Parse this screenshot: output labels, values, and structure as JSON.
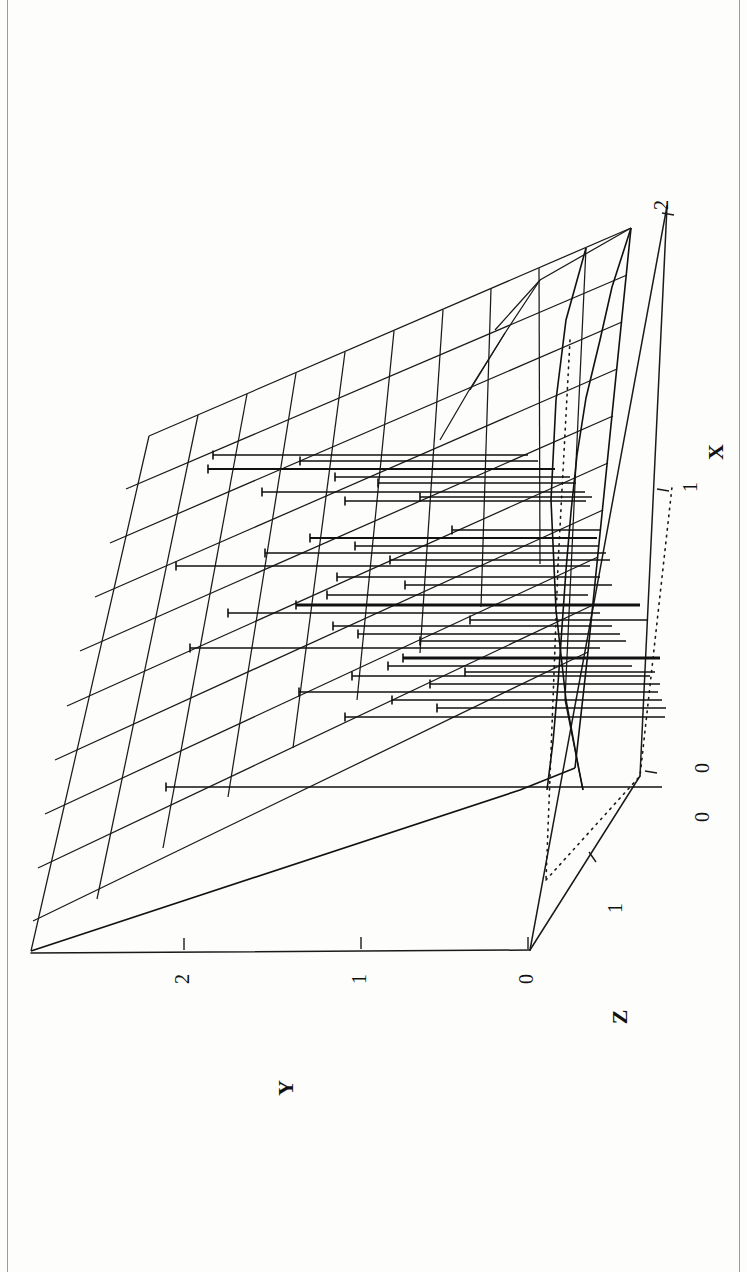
{
  "figure": {
    "kind": "3d-mesh-surface-plot",
    "orientation": "rotated-90-landscape-on-portrait-page",
    "background_color": "#fdfdfc",
    "ink_color": "#111111"
  },
  "axes": {
    "x": {
      "label": "X",
      "ticks": [
        "0",
        "1",
        "2"
      ],
      "tick_values": [
        0,
        1,
        2
      ],
      "range": [
        0,
        2
      ]
    },
    "y": {
      "label": "Y",
      "ticks": [
        "0",
        "1",
        "2"
      ],
      "tick_values": [
        0,
        1,
        2
      ],
      "range": [
        0,
        2
      ]
    },
    "z": {
      "label": "Z",
      "ticks": [
        "0",
        "1"
      ],
      "tick_values": [
        0,
        1
      ],
      "range": [
        0,
        1
      ]
    }
  },
  "chart_data": {
    "type": "line",
    "title": "",
    "subtitle": "",
    "xlabel": "X",
    "ylabel": "Y",
    "zlabel": "Z",
    "xlim": [
      0,
      2
    ],
    "ylim": [
      0,
      2
    ],
    "zlim": [
      0,
      1
    ],
    "grid": true,
    "legend": "none",
    "projection": "3d-perspective",
    "annotations": [],
    "mesh": {
      "description": "Regular quadrilateral wireframe surface mesh spanning the X-Y domain",
      "rows": 10,
      "cols": 10,
      "u_range": [
        0,
        2
      ],
      "v_range": [
        0,
        2
      ]
    },
    "reference_lines": [
      {
        "name": "vertical-dotted-dropline",
        "style": "dotted"
      },
      {
        "name": "diagonal-dotted-baseline",
        "style": "dotted"
      }
    ],
    "series": [
      {
        "name": "horizontal-data-segments",
        "description": "Horizontal line segments with end tick caps drawn across the mesh surface (interval / error-bar style markers)",
        "count": 34,
        "segments": [
          {
            "y": 455,
            "x0": 213,
            "x1": 528,
            "w": 1.5,
            "cap": "left"
          },
          {
            "y": 461,
            "x0": 300,
            "x1": 538,
            "w": 1.5,
            "cap": "left"
          },
          {
            "y": 469,
            "x0": 208,
            "x1": 555,
            "w": 1.9,
            "cap": "left"
          },
          {
            "y": 477,
            "x0": 335,
            "x1": 570,
            "w": 1.3,
            "cap": "left"
          },
          {
            "y": 483,
            "x0": 378,
            "x1": 576,
            "w": 1.3,
            "cap": "left"
          },
          {
            "y": 492,
            "x0": 262,
            "x1": 585,
            "w": 1.3,
            "cap": "left"
          },
          {
            "y": 501,
            "x0": 345,
            "x1": 586,
            "w": 1.3,
            "cap": "left"
          },
          {
            "y": 538,
            "x0": 310,
            "x1": 597,
            "w": 1.8,
            "cap": "left"
          },
          {
            "y": 546,
            "x0": 355,
            "x1": 598,
            "w": 1.3,
            "cap": "left"
          },
          {
            "y": 553,
            "x0": 265,
            "x1": 606,
            "w": 1.4,
            "cap": "left"
          },
          {
            "y": 560,
            "x0": 390,
            "x1": 610,
            "w": 1.3,
            "cap": "left"
          },
          {
            "y": 566,
            "x0": 176,
            "x1": 590,
            "w": 1.5,
            "cap": "left"
          },
          {
            "y": 577,
            "x0": 337,
            "x1": 600,
            "w": 1.3,
            "cap": "left"
          },
          {
            "y": 585,
            "x0": 405,
            "x1": 612,
            "w": 1.3,
            "cap": "left"
          },
          {
            "y": 595,
            "x0": 327,
            "x1": 588,
            "w": 1.4,
            "cap": "left"
          },
          {
            "y": 605,
            "x0": 296,
            "x1": 640,
            "w": 3.1,
            "cap": "left"
          },
          {
            "y": 613,
            "x0": 228,
            "x1": 600,
            "w": 1.3,
            "cap": "left"
          },
          {
            "y": 626,
            "x0": 333,
            "x1": 612,
            "w": 1.4,
            "cap": "left"
          },
          {
            "y": 634,
            "x0": 358,
            "x1": 620,
            "w": 1.4,
            "cap": "left"
          },
          {
            "y": 641,
            "x0": 420,
            "x1": 626,
            "w": 1.3,
            "cap": "left"
          },
          {
            "y": 648,
            "x0": 190,
            "x1": 600,
            "w": 1.4,
            "cap": "left"
          },
          {
            "y": 658,
            "x0": 403,
            "x1": 660,
            "w": 3.0,
            "cap": "left"
          },
          {
            "y": 666,
            "x0": 388,
            "x1": 632,
            "w": 1.3,
            "cap": "left"
          },
          {
            "y": 676,
            "x0": 352,
            "x1": 650,
            "w": 1.3,
            "cap": "left"
          },
          {
            "y": 684,
            "x0": 430,
            "x1": 660,
            "w": 1.4,
            "cap": "left"
          },
          {
            "y": 692,
            "x0": 299,
            "x1": 658,
            "w": 1.4,
            "cap": "left"
          },
          {
            "y": 700,
            "x0": 392,
            "x1": 662,
            "w": 1.5,
            "cap": "left"
          },
          {
            "y": 708,
            "x0": 437,
            "x1": 666,
            "w": 1.4,
            "cap": "left"
          },
          {
            "y": 717,
            "x0": 345,
            "x1": 665,
            "w": 1.3,
            "cap": "left"
          },
          {
            "y": 787,
            "x0": 166,
            "x1": 662,
            "w": 1.4,
            "cap": "left"
          },
          {
            "y": 497,
            "x0": 420,
            "x1": 592,
            "w": 1.3,
            "cap": "left"
          },
          {
            "y": 530,
            "x0": 452,
            "x1": 600,
            "w": 1.3,
            "cap": "left"
          },
          {
            "y": 620,
            "x0": 470,
            "x1": 648,
            "w": 1.3,
            "cap": "left"
          },
          {
            "y": 672,
            "x0": 465,
            "x1": 655,
            "w": 1.3,
            "cap": "left"
          }
        ]
      }
    ]
  }
}
